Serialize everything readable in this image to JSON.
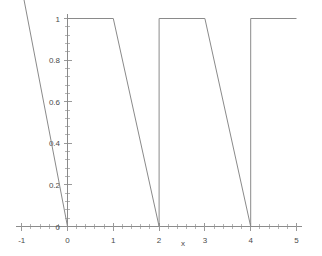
{
  "chart_data": {
    "type": "line",
    "title": "",
    "subtitle": "",
    "xlabel": "x",
    "ylabel": "",
    "xlim": [
      -1,
      5
    ],
    "ylim": [
      0,
      1
    ],
    "grid": false,
    "legend": null,
    "x_ticks": [
      -1,
      0,
      1,
      2,
      3,
      4,
      5
    ],
    "x_tick_labels": [
      "-1",
      "0",
      "1",
      "2",
      "3",
      "4",
      "5"
    ],
    "y_ticks": [
      0,
      0.2,
      0.4,
      0.6,
      0.8,
      1
    ],
    "y_tick_labels": [
      "0",
      "0.2",
      "0.4",
      "0.6",
      "0.8",
      "1"
    ],
    "series": [
      {
        "name": "periodic trapezoidal wave",
        "color": "#8a8a8a",
        "description": "Plateau at 1 for one unit, then linear descent to 0 over the next unit, period 2; extrapolated descending ray for x below 0",
        "segments": [
          {
            "name": "left-descending-ray",
            "points": [
              [
                -1.35,
                1.55
              ],
              [
                0,
                0
              ]
            ]
          },
          {
            "name": "rise-at-0",
            "points": [
              [
                0,
                0
              ],
              [
                0,
                1
              ]
            ]
          },
          {
            "name": "plateau-0-to-1",
            "points": [
              [
                0,
                1
              ],
              [
                1,
                1
              ]
            ]
          },
          {
            "name": "descent-1-to-2",
            "points": [
              [
                1,
                1
              ],
              [
                2,
                0
              ]
            ]
          },
          {
            "name": "rise-at-2",
            "points": [
              [
                2,
                0
              ],
              [
                2,
                1
              ]
            ]
          },
          {
            "name": "plateau-2-to-3",
            "points": [
              [
                2,
                1
              ],
              [
                3,
                1
              ]
            ]
          },
          {
            "name": "descent-3-to-4",
            "points": [
              [
                3,
                1
              ],
              [
                4,
                0
              ]
            ]
          },
          {
            "name": "rise-at-4",
            "points": [
              [
                4,
                0
              ],
              [
                4,
                1
              ]
            ]
          },
          {
            "name": "plateau-4-to-5",
            "points": [
              [
                4,
                1
              ],
              [
                5,
                1
              ]
            ]
          }
        ],
        "x": [
          -1.35,
          0,
          0,
          1,
          2,
          2,
          3,
          4,
          4,
          5
        ],
        "values": [
          1.55,
          0,
          1,
          1,
          0,
          1,
          1,
          0,
          1,
          1
        ]
      }
    ]
  },
  "axes": {
    "x_axis_name": "x",
    "minor_ticks_per_interval": 4
  },
  "colors": {
    "curve": "#8a8a8a",
    "axis": "#8c8c8c",
    "tick": "#9a9a9a",
    "minor_tick": "#b4b4b4",
    "text": "#4a4a4a",
    "background": "#ffffff"
  }
}
